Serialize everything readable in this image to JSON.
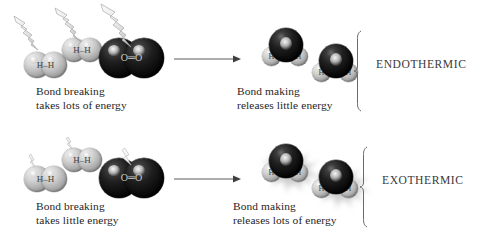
{
  "figure": {
    "background": "#ffffff",
    "ink": "#262626"
  },
  "palette": {
    "hydrogen": "#c2c2c2",
    "oxygen": "#111111",
    "energy_in": "#e6e6e6",
    "energy_out": "#b4b4b4",
    "rule": "#555555"
  },
  "rows": [
    {
      "id": "endothermic",
      "term": "ENDOTHERMIC",
      "left_caption": {
        "line1": "Bond breaking",
        "line2": "takes lots of energy"
      },
      "right_caption": {
        "line1": "Bond making",
        "line2": "releases little energy"
      },
      "reactants": [
        {
          "kind": "hydrogen-molecule",
          "label": "H–H",
          "atoms": [
            "H",
            "H"
          ],
          "energy": "large-bolt-in"
        },
        {
          "kind": "hydrogen-molecule",
          "label": "H–H",
          "atoms": [
            "H",
            "H"
          ],
          "energy": "large-bolt-in"
        },
        {
          "kind": "oxygen-molecule",
          "label": "O═O",
          "atoms": [
            "O",
            "O"
          ],
          "energy": "large-bolt-in"
        }
      ],
      "products": [
        {
          "kind": "water-molecule",
          "atoms": [
            "O",
            "H",
            "H"
          ],
          "label": "H–O–H",
          "energy": "none"
        },
        {
          "kind": "water-molecule",
          "atoms": [
            "O",
            "H",
            "H"
          ],
          "label": "H–O–H",
          "energy": "none"
        }
      ],
      "arrow": "reaction-arrow-right"
    },
    {
      "id": "exothermic",
      "term": "EXOTHERMIC",
      "left_caption": {
        "line1": "Bond breaking",
        "line2": "takes little energy"
      },
      "right_caption": {
        "line1": "Bond making",
        "line2": "releases lots of energy"
      },
      "reactants": [
        {
          "kind": "hydrogen-molecule",
          "label": "H–H",
          "atoms": [
            "H",
            "H"
          ],
          "energy": "small-bolt-in"
        },
        {
          "kind": "hydrogen-molecule",
          "label": "H–H",
          "atoms": [
            "H",
            "H"
          ],
          "energy": "small-bolt-in"
        },
        {
          "kind": "oxygen-molecule",
          "label": "O═O",
          "atoms": [
            "O",
            "O"
          ],
          "energy": "small-bolt-in"
        }
      ],
      "products": [
        {
          "kind": "water-molecule",
          "atoms": [
            "O",
            "H",
            "H"
          ],
          "label": "H–O–H",
          "energy": "large-burst-out"
        },
        {
          "kind": "water-molecule",
          "atoms": [
            "O",
            "H",
            "H"
          ],
          "label": "H–O–H",
          "energy": "large-burst-out"
        }
      ],
      "arrow": "reaction-arrow-right"
    }
  ],
  "atom_text": {
    "h": "H",
    "o": "O",
    "hh_bond": "–",
    "oo_bond": "═"
  }
}
